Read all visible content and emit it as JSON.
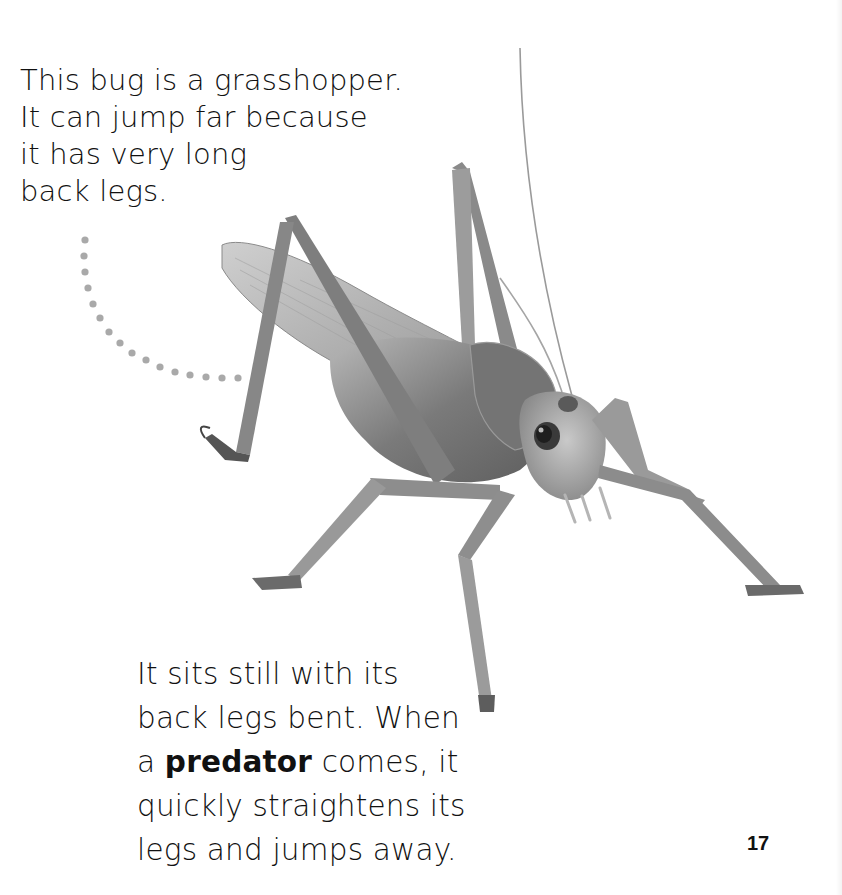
{
  "page": {
    "intro_paragraph": {
      "lines": [
        "This bug is a grasshopper.",
        "It can jump far because",
        "it has very long",
        "back legs."
      ]
    },
    "body_paragraph": {
      "line_1": "It sits still with its",
      "line_2": "back legs bent. When",
      "line_3_prefix": "a ",
      "line_3_bold": "predator",
      "line_3_suffix": " comes, it",
      "line_4": "quickly straightens its",
      "line_5": "legs and jumps away."
    },
    "page_number": "17",
    "image": {
      "subject": "grasshopper-photo",
      "annotation": "dotted-pointer-to-back-leg"
    },
    "colors": {
      "text": "#111111",
      "dots": "#a9a9a9",
      "background": "#ffffff"
    }
  }
}
